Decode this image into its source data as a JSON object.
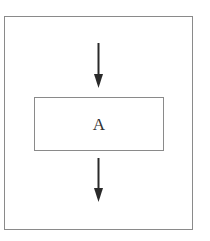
{
  "diagram": {
    "type": "flowchart",
    "frame": {
      "stroke": "#8a8a8a"
    },
    "nodes": [
      {
        "id": "A",
        "label": "A",
        "shape": "rectangle"
      }
    ],
    "edges": [
      {
        "from": "entry",
        "to": "A",
        "direction": "down"
      },
      {
        "from": "A",
        "to": "exit",
        "direction": "down"
      }
    ],
    "colors": {
      "stroke": "#8a8a8a",
      "arrow": "#2a2a2a",
      "text": "#333333",
      "background": "#ffffff"
    }
  }
}
